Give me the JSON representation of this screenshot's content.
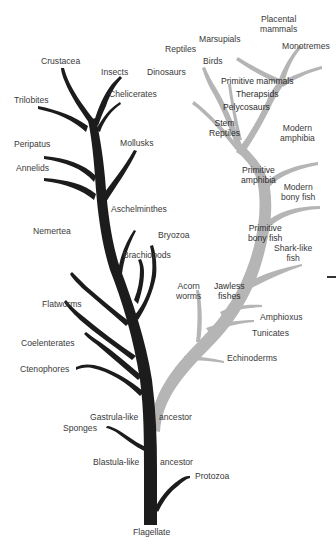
{
  "diagram": {
    "colors": {
      "invertebrate_branch": "#1c1c1c",
      "chordate_branch": "#b5b5b5",
      "label_text": "#3a3a3a",
      "background": "#ffffff"
    },
    "root": "Flagellate",
    "nodes": {
      "blastula": "Blastula-like",
      "blastula_ancestor": "ancestor",
      "gastrula": "Gastrula-like",
      "gastrula_ancestor": "ancestor"
    },
    "invertebrate_labels": {
      "protozoa": "Protozoa",
      "sponges": "Sponges",
      "ctenophores": "Ctenophores",
      "coelenterates": "Coelenterates",
      "flatworms": "Flatworms",
      "nemertea": "Nemertea",
      "brachiopods": "Brachiopods",
      "bryozoa": "Bryozoa",
      "aschelminthes": "Aschelminthes",
      "annelids": "Annelids",
      "peripatus": "Peripatus",
      "mollusks": "Mollusks",
      "trilobites": "Trilobites",
      "crustacea": "Crustacea",
      "insects": "Insects",
      "chelicerates": "Chelicerates"
    },
    "chordate_labels": {
      "echinoderms": "Echinoderms",
      "acorn_worms_1": "Acorn",
      "acorn_worms_2": "worms",
      "tunicates": "Tunicates",
      "amphioxus": "Amphioxus",
      "jawless_1": "Jawless",
      "jawless_2": "fishes",
      "shark_1": "Shark-like",
      "shark_2": "fish",
      "prim_bony_1": "Primitive",
      "prim_bony_2": "bony fish",
      "modern_bony_1": "Modern",
      "modern_bony_2": "bony fish",
      "prim_amph_1": "Primitive",
      "prim_amph_2": "amphibia",
      "modern_amph_1": "Modern",
      "modern_amph_2": "amphibia",
      "stem_rep_1": "Stem",
      "stem_rep_2": "Reptiles",
      "pelycosaurs": "Pelycosaurs",
      "therapsids": "Therapsids",
      "prim_mammals": "Primitive mammals",
      "monotremes": "Monotremes",
      "placental_1": "Placental",
      "placental_2": "mammals",
      "marsupials": "Marsupials",
      "birds": "Birds",
      "reptiles": "Reptiles",
      "dinosaurs": "Dinosaurs"
    }
  }
}
